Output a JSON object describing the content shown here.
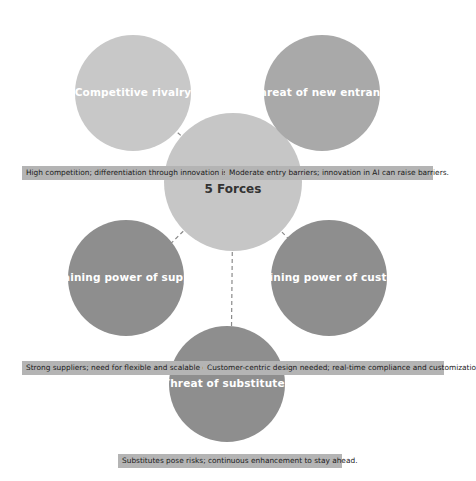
{
  "canvas": {
    "width": 476,
    "height": 481,
    "background": "#ffffff"
  },
  "palette": {
    "light_grey": "#c8c8c8",
    "medium_grey": "#a9a9a9",
    "dark_grey": "#8e8e8e",
    "hub_grey": "#c6c6c6",
    "label_bar": "#b4b4b4",
    "line": "#8a8a8a",
    "node_text": "#ffffff",
    "hub_text": "#333333",
    "desc_text": "#1a1a1a"
  },
  "hub": {
    "line1": "Porter's",
    "line2": "5 Forces",
    "cx": 233,
    "cy": 182,
    "r": 69,
    "fill": "#c6c6c6"
  },
  "forces": [
    {
      "id": "competitive-rivalry",
      "label": "Competitive rivalry",
      "cx": 133,
      "cy": 93,
      "r": 58,
      "fill": "#c8c8c8"
    },
    {
      "id": "threat-of-new-entrants",
      "label": "Threat of new entrants",
      "cx": 322,
      "cy": 93,
      "r": 58,
      "fill": "#a9a9a9"
    },
    {
      "id": "bargaining-power-of-suppliers",
      "label": "Bargaining power of suppliers",
      "cx": 126,
      "cy": 278,
      "r": 58,
      "fill": "#8e8e8e"
    },
    {
      "id": "bargaining-power-of-customers",
      "label": "Bargaining power of customers",
      "cx": 329,
      "cy": 278,
      "r": 58,
      "fill": "#8e8e8e"
    },
    {
      "id": "threat-of-substitutes",
      "label": "Threat of substitutes",
      "cx": 227,
      "cy": 384,
      "r": 58,
      "fill": "#8e8e8e"
    }
  ],
  "descriptions": [
    {
      "id": "desc-competitive-rivalry",
      "text": "High competition; differentiation through innovation is crucial.",
      "left": 22,
      "top": 166,
      "width": 214
    },
    {
      "id": "desc-threat-of-new-entrants",
      "text": "Moderate entry barriers; innovation in AI can raise barriers.",
      "left": 225,
      "top": 166,
      "width": 208
    },
    {
      "id": "desc-bargaining-power-of-suppliers",
      "text": "Strong suppliers; need for flexible and scalable data integration.",
      "left": 22,
      "top": 361,
      "width": 218
    },
    {
      "id": "desc-bargaining-power-of-customers",
      "text": "Customer-centric design needed; real-time compliance and customization.",
      "left": 203,
      "top": 361,
      "width": 241
    },
    {
      "id": "desc-threat-of-substitutes",
      "text": "Substitutes pose risks; continuous enhancement to stay ahead.",
      "left": 118,
      "top": 454,
      "width": 224
    }
  ],
  "connectors": [
    {
      "id": "connector-competitive-rivalry",
      "x1": 233,
      "y1": 182,
      "x2": 141,
      "y2": 100
    },
    {
      "id": "connector-threat-of-new-entrants",
      "x1": 233,
      "y1": 182,
      "x2": 314,
      "y2": 100
    },
    {
      "id": "connector-bargaining-power-of-suppliers",
      "x1": 233,
      "y1": 182,
      "x2": 142,
      "y2": 272
    },
    {
      "id": "connector-bargaining-power-of-customers",
      "x1": 233,
      "y1": 182,
      "x2": 321,
      "y2": 272
    },
    {
      "id": "connector-threat-of-substitutes",
      "x1": 233,
      "y1": 182,
      "x2": 231,
      "y2": 378
    }
  ]
}
